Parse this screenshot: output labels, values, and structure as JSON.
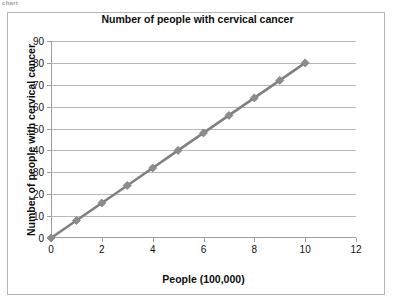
{
  "stray_text": "chart",
  "chart_data": {
    "type": "line",
    "title": "Number of people with cervical cancer",
    "xlabel": "People (100,000)",
    "ylabel": "Number of people with cervical cancer",
    "x": [
      0,
      1,
      2,
      3,
      4,
      5,
      6,
      7,
      8,
      9,
      10
    ],
    "values": [
      0,
      8,
      16,
      24,
      32,
      40,
      48,
      56,
      64,
      72,
      80
    ],
    "series": [
      {
        "name": "Number of people with cervical cancer",
        "values": [
          0,
          8,
          16,
          24,
          32,
          40,
          48,
          56,
          64,
          72,
          80
        ]
      }
    ],
    "xlim": [
      0,
      12
    ],
    "ylim": [
      0,
      90
    ],
    "x_ticks": [
      0,
      2,
      4,
      6,
      8,
      10,
      12
    ],
    "y_ticks": [
      0,
      10,
      20,
      30,
      40,
      50,
      60,
      70,
      80,
      90
    ],
    "x_tick_labels": [
      "0",
      "2",
      "4",
      "6",
      "8",
      "10",
      "12"
    ],
    "y_tick_labels": [
      "0",
      "10",
      "20",
      "30",
      "40",
      "50",
      "60",
      "70",
      "80",
      "90"
    ],
    "grid": true,
    "grid_axis": "y",
    "legend": false,
    "marker": "diamond",
    "line_color": "#808080",
    "marker_color": "#8c8c8c",
    "gridline_color": "#b9b9b9",
    "axis_color": "#9d9d9d",
    "plot_background": "#ffffff",
    "frame_color": "#b4b4b4"
  }
}
